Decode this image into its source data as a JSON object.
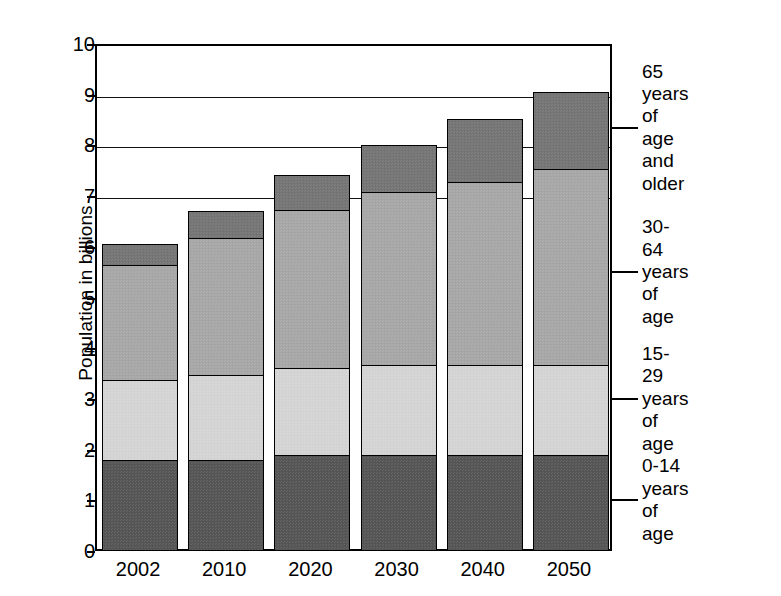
{
  "chart_data": {
    "type": "bar",
    "subtype": "stacked-bar",
    "title": "",
    "xlabel": "",
    "ylabel": "Population in billions",
    "categories": [
      "2002",
      "2010",
      "2020",
      "2030",
      "2040",
      "2050"
    ],
    "ylim": [
      0,
      10
    ],
    "yticks": [
      0,
      1,
      2,
      3,
      4,
      5,
      6,
      7,
      8,
      9,
      10
    ],
    "ytick_labels": [
      "0",
      "1",
      "2",
      "3",
      "4",
      "5",
      "6",
      "7",
      "8",
      "9",
      "10"
    ],
    "gridlines": [
      7,
      8,
      9,
      10
    ],
    "grid": true,
    "legend_position": "right-outside",
    "series": [
      {
        "name": "0-14 years of age",
        "label_line1": "0-14",
        "label_line2": "years of age",
        "color": "#565656",
        "values": [
          1.8,
          1.8,
          1.9,
          1.9,
          1.9,
          1.9
        ],
        "legend_value": 1.0
      },
      {
        "name": "15-29 years of age",
        "label_line1": "15-29",
        "label_line2": "years of age",
        "color": "#d6d6d6",
        "values": [
          1.6,
          1.7,
          1.75,
          1.8,
          1.8,
          1.8
        ],
        "legend_value": 3.0
      },
      {
        "name": "30-64 years of age",
        "label_line1": "30-64",
        "label_line2": "years of age",
        "color": "#a8a8a8",
        "values": [
          2.3,
          2.75,
          3.15,
          3.45,
          3.65,
          3.9
        ],
        "legend_value": 5.5
      },
      {
        "name": "65 years of age and older",
        "label_line1": "65 years of",
        "label_line2": "age and older",
        "color": "#767676",
        "values": [
          0.45,
          0.55,
          0.7,
          0.95,
          1.25,
          1.55
        ],
        "legend_value": 8.35
      }
    ],
    "totals": [
      6.15,
      6.8,
      7.5,
      8.1,
      8.65,
      9.15
    ]
  },
  "legend": [
    {
      "line1": "65 years of",
      "line2": "age and older",
      "anchor": 8.35
    },
    {
      "line1": "30-64",
      "line2": "years of age",
      "anchor": 5.5
    },
    {
      "line1": "15-29",
      "line2": "years of age",
      "anchor": 3.0
    },
    {
      "line1": "0-14",
      "line2": "years of age",
      "anchor": 1.0
    }
  ]
}
